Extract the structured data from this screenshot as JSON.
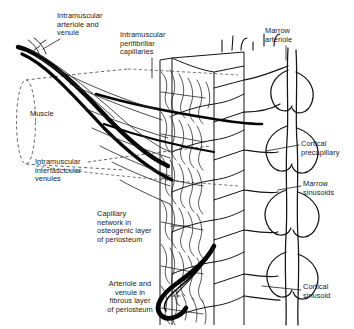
{
  "figure": {
    "kind": "anatomical-line-diagram",
    "background_color": "#ffffff",
    "ink_color": "#111111",
    "text_color": "#1b1b22"
  },
  "labels": [
    {
      "id": "intramuscular-arteriole-venule",
      "text": "Intramuscular\narteriole and\nvenule",
      "x": 57,
      "y": 12,
      "width": 70,
      "align": "left"
    },
    {
      "id": "intramuscular-perifibrillar-capillaries",
      "text": "Intramuscular\nperifibrillar\ncapillaries",
      "x": 120,
      "y": 31,
      "width": 70,
      "align": "left"
    },
    {
      "id": "marrow-arteriole",
      "text": "Marrow\narteriole",
      "x": 265,
      "y": 27,
      "width": 54,
      "align": "left"
    },
    {
      "id": "muscle",
      "text": "Muscle",
      "x": 30,
      "y": 110,
      "width": 42,
      "align": "left"
    },
    {
      "id": "cortical-precapillary",
      "text": "Cortical\nprecapillary",
      "x": 301,
      "y": 140,
      "width": 54,
      "align": "left"
    },
    {
      "id": "intramuscular-interfascicular-venules",
      "text": "Intramuscular\ninterfascicular\nvenules",
      "x": 35,
      "y": 158,
      "width": 72,
      "align": "left"
    },
    {
      "id": "marrow-sinusoids",
      "text": "Marrow\nsinusoids",
      "x": 303,
      "y": 180,
      "width": 50,
      "align": "left"
    },
    {
      "id": "capillary-network-osteogenic-periosteum",
      "text": "Capillary\nnetwork in\nosteogenic layer\nof periosteum",
      "x": 97,
      "y": 210,
      "width": 72,
      "align": "left"
    },
    {
      "id": "cortical-sinusoid",
      "text": "Cortical\nsinusoid",
      "x": 303,
      "y": 283,
      "width": 50,
      "align": "left"
    },
    {
      "id": "arteriole-venule-fibrous-periosteum",
      "text": "Arteriole and\nvenule in\nfibrous layer\nof periosteum",
      "x": 93,
      "y": 280,
      "width": 74,
      "align": "center"
    }
  ],
  "structures": [
    {
      "id": "muscle-cylinder",
      "name": "muscle cylinder outline",
      "style": "dashed"
    },
    {
      "id": "muscle-extent-guide",
      "name": "muscle extent guide",
      "style": "dashed"
    },
    {
      "id": "bone-cortex-block",
      "name": "cut block of bone cortex",
      "style": "solid"
    },
    {
      "id": "periosteum-band",
      "name": "periosteal capillary network band",
      "style": "solid"
    },
    {
      "id": "marrow-cavity",
      "name": "marrow cavity vessel network",
      "style": "solid"
    },
    {
      "id": "major-arterioles",
      "name": "thick intramuscular arterioles",
      "style": "solid-heavy"
    },
    {
      "id": "periosteal-hook-vessel",
      "name": "arteriole and venule of fibrous periosteum",
      "style": "solid-heavy"
    }
  ]
}
